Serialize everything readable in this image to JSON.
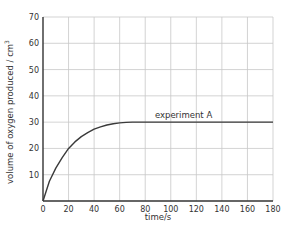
{
  "chart_data": {
    "type": "line",
    "title": "",
    "xlabel": "time/s",
    "ylabel": "volume of oxygen produced / cm",
    "ylabel_superscript": "3",
    "xlim": [
      0,
      180
    ],
    "ylim": [
      0,
      70
    ],
    "x_ticks": [
      0,
      20,
      40,
      60,
      80,
      100,
      120,
      140,
      160,
      180
    ],
    "y_ticks": [
      10,
      20,
      30,
      40,
      50,
      60,
      70
    ],
    "grid": true,
    "legend": "none (inline annotation)",
    "series": [
      {
        "name": "experiment A",
        "x": [
          0,
          5,
          10,
          15,
          20,
          25,
          30,
          35,
          40,
          45,
          50,
          55,
          60,
          65,
          70,
          80,
          100,
          120,
          140,
          160,
          180
        ],
        "values": [
          0,
          7.5,
          12.5,
          16.5,
          20,
          22.5,
          24.5,
          26,
          27.3,
          28.2,
          28.9,
          29.4,
          29.7,
          29.9,
          30,
          30,
          30,
          30,
          30,
          30,
          30
        ]
      }
    ],
    "annotations": [
      {
        "text": "experiment A",
        "x": 110,
        "y": 31.5
      }
    ]
  },
  "colors": {
    "grid": "#c8c8c8",
    "axis": "#333333",
    "line": "#3a3a3a",
    "text": "#333333"
  }
}
